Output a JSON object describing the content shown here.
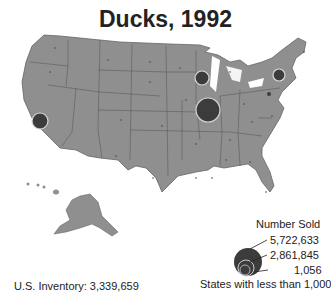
{
  "title": "Ducks, 1992",
  "footer": {
    "inventory": "U.S. Inventory: 3,339,659"
  },
  "legend": {
    "title": "Number Sold",
    "values": [
      "5,722,633",
      "2,861,845",
      "1,056"
    ],
    "note": "States with less than 1,000"
  },
  "colors": {
    "land": "#8f8f8f",
    "border": "#555555",
    "bubble": "#3c3c3c",
    "bubble_ring": "#d8d8d8"
  },
  "bubbles": [
    {
      "state": "Indiana",
      "cx": 208,
      "cy": 110,
      "r": 12
    },
    {
      "state": "Wisconsin",
      "cx": 202,
      "cy": 78,
      "r": 7
    },
    {
      "state": "New York",
      "cx": 279,
      "cy": 75,
      "r": 6
    },
    {
      "state": "California",
      "cx": 40,
      "cy": 121,
      "r": 8
    },
    {
      "state": "Pennsylvania",
      "cx": 269,
      "cy": 94,
      "r": 2
    }
  ]
}
